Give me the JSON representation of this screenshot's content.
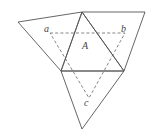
{
  "diagram": {
    "labels": {
      "a": "a",
      "b": "b",
      "c": "c",
      "A": "A"
    },
    "colors": {
      "stroke": "#555555",
      "dashed": "#666666",
      "background": "#ffffff"
    }
  }
}
